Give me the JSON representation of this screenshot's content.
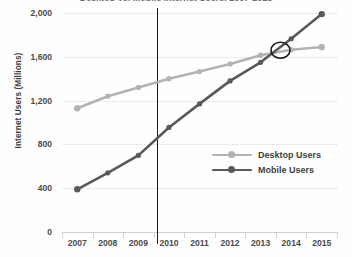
{
  "chart_data": {
    "type": "line",
    "title": "Desktop vs. Mobile Internet Users, 2007-2015",
    "xlabel": "",
    "ylabel": "Internet Users (Millions)",
    "categories": [
      "2007",
      "2008",
      "2009",
      "2010",
      "2011",
      "2012",
      "2013",
      "2014",
      "2015"
    ],
    "x": [
      2007,
      2008,
      2009,
      2010,
      2011,
      2012,
      2013,
      2014,
      2015
    ],
    "ylim": [
      0,
      2000
    ],
    "yticks": [
      0,
      400,
      800,
      1200,
      1600,
      2000
    ],
    "ytick_labels": [
      "0",
      "400",
      "800",
      "1,200",
      "1,600",
      "2,000"
    ],
    "grid": true,
    "legend_position": "center-right",
    "series": [
      {
        "name": "Desktop Users",
        "color": "#b3b3b3",
        "marker": "circle",
        "values": [
          1130,
          1240,
          1320,
          1400,
          1465,
          1535,
          1615,
          1665,
          1690
        ]
      },
      {
        "name": "Mobile Users",
        "color": "#595959",
        "marker": "circle",
        "values": [
          390,
          540,
          700,
          955,
          1170,
          1380,
          1550,
          1765,
          1990
        ]
      }
    ],
    "annotations": [
      {
        "type": "vertical-line",
        "name": "reference-line",
        "x": 2009.6,
        "color": "#1a1a1a"
      },
      {
        "type": "ellipse",
        "name": "crossover-highlight",
        "x": 2013.65,
        "y": 1660,
        "color": "#1a1a1a"
      }
    ]
  },
  "axes": {
    "y_title": "Internet Users (Millions)",
    "y_tick_labels": [
      "2,000",
      "1,600",
      "1,200",
      "800",
      "400",
      "0"
    ],
    "x_tick_labels": [
      "2007",
      "2008",
      "2009",
      "2010",
      "2011",
      "2012",
      "2013",
      "2014",
      "2015"
    ]
  },
  "legend": {
    "items": [
      {
        "label": "Desktop Users",
        "color": "#b3b3b3"
      },
      {
        "label": "Mobile Users",
        "color": "#595959"
      }
    ]
  },
  "title_clipped": "Desktop vs. Mobile Internet Users, 2007-2015"
}
